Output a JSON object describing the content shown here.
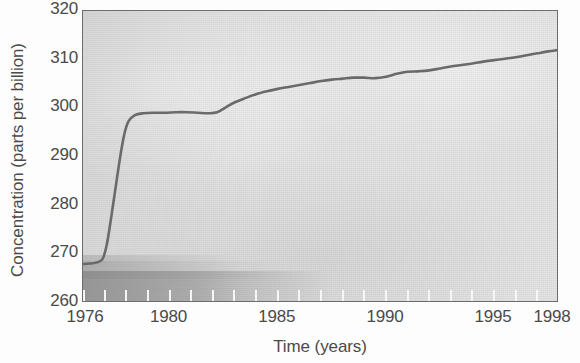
{
  "figure": {
    "name": "nitrous-oxide-concentration-trend",
    "axis_color": "#6d6d6d",
    "line_color": "#6a6a6a",
    "plot_bg": "#e2e2e2"
  },
  "chart_data": {
    "type": "line",
    "title": "",
    "xlabel": "Time (years)",
    "ylabel": "Concentration (parts per billion)",
    "xlim": [
      1976,
      1998
    ],
    "ylim": [
      260,
      320
    ],
    "grid": false,
    "legend": null,
    "xticks": [
      1976,
      1980,
      1985,
      1990,
      1995,
      1998
    ],
    "xtick_labels": [
      "1976",
      "1980",
      "1985",
      "1990",
      "1995",
      "1998"
    ],
    "minor_xtick_interval": 1,
    "yticks": [
      260,
      270,
      280,
      290,
      300,
      310,
      320
    ],
    "ytick_labels": [
      "260",
      "270",
      "280",
      "290",
      "300",
      "310",
      "320"
    ],
    "series": [
      {
        "name": "Concentration",
        "x": [
          1976.0,
          1976.3,
          1976.6,
          1976.9,
          1977.1,
          1977.3,
          1977.5,
          1977.7,
          1977.9,
          1978.1,
          1978.4,
          1978.8,
          1979.3,
          1979.8,
          1980.3,
          1980.8,
          1981.3,
          1981.8,
          1982.2,
          1982.6,
          1983.0,
          1983.5,
          1984.0,
          1984.5,
          1985.0,
          1985.5,
          1986.0,
          1986.5,
          1987.0,
          1987.5,
          1988.0,
          1988.5,
          1989.0,
          1989.5,
          1990.0,
          1990.5,
          1991.0,
          1991.5,
          1992.0,
          1992.5,
          1993.0,
          1993.5,
          1994.0,
          1994.5,
          1995.0,
          1995.5,
          1996.0,
          1996.5,
          1997.0,
          1997.5,
          1998.0
        ],
        "y": [
          268.0,
          268.1,
          268.3,
          269.0,
          272.0,
          277.5,
          283.5,
          289.5,
          294.5,
          297.3,
          298.6,
          299.0,
          299.1,
          299.1,
          299.2,
          299.2,
          299.1,
          299.0,
          299.2,
          300.2,
          301.2,
          302.1,
          302.9,
          303.5,
          304.0,
          304.4,
          304.8,
          305.2,
          305.6,
          305.9,
          306.1,
          306.3,
          306.3,
          306.2,
          306.5,
          307.1,
          307.5,
          307.6,
          307.8,
          308.2,
          308.6,
          308.9,
          309.2,
          309.6,
          309.9,
          310.2,
          310.5,
          310.9,
          311.3,
          311.7,
          312.0
        ]
      }
    ]
  }
}
